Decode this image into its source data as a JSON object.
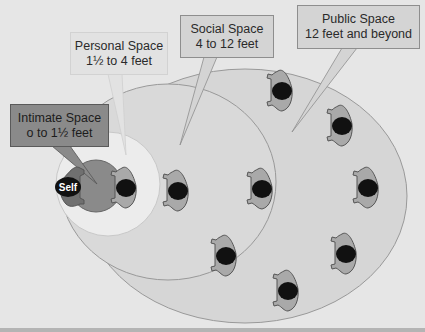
{
  "diagram": {
    "type": "proxemics",
    "self_label": "Self",
    "zones": [
      {
        "name": "Intimate Space",
        "range": "o to 1½ feet",
        "color": "#7e7e7e"
      },
      {
        "name": "Personal Space",
        "range": "1½ to 4 feet",
        "color": "#ececec"
      },
      {
        "name": "Social Space",
        "range": "4 to 12 feet",
        "color": "#d8d8d8"
      },
      {
        "name": "Public Space",
        "range": "12 feet and beyond",
        "color": "#d6d6d6"
      }
    ],
    "person_color": "#a9a9a9",
    "head_color": "#111111",
    "background": "#e6e6e6"
  }
}
